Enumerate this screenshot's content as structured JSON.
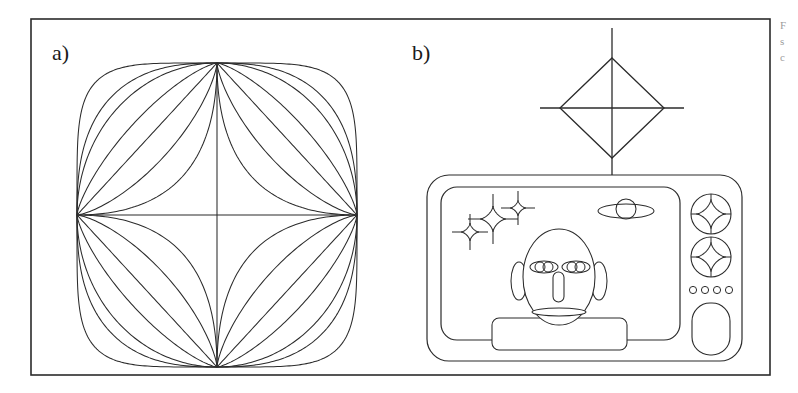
{
  "figure": {
    "background": "#ffffff",
    "stroke": "#2b2b2b",
    "border": {
      "x": 31,
      "y": 19,
      "width": 739,
      "height": 356,
      "stroke_width": 1.6
    }
  },
  "panels": [
    {
      "id": "a",
      "label": "a)",
      "label_x": 52,
      "label_y": 60
    },
    {
      "id": "b",
      "label": "b)",
      "label_x": 412,
      "label_y": 60
    }
  ],
  "caption_overflow": {
    "line1": "F",
    "line2": "s",
    "line3": "c"
  },
  "panel_a": {
    "name": "superellipse-family",
    "center_x": 217,
    "center_y": 215,
    "radius_x": 140,
    "radius_y": 152,
    "exponents": [
      5,
      2.6,
      2,
      1.35,
      1,
      0.72,
      0.5
    ],
    "exponent_labels": [
      "n=5",
      "n=2.6",
      "n=2",
      "n=1.35",
      "n=1",
      "n=0.72",
      "n=0.5"
    ],
    "description": "Nested superellipse curves |x/a|^n + |y/b|^n = 1 sharing the same four axis vertices"
  },
  "panel_b": {
    "name": "retro-television-with-alien",
    "tv_body": {
      "x": 427,
      "y": 175,
      "width": 315,
      "height": 186,
      "radius": 22
    },
    "screen": {
      "x": 441,
      "y": 187,
      "width": 239,
      "height": 153,
      "radius": 16
    },
    "antenna": {
      "mast_x": 612,
      "mast_top": 28,
      "mast_bottom": 175,
      "diamond_center_x": 612,
      "diamond_center_y": 108,
      "diamond_half_width": 52,
      "diamond_half_height": 50,
      "crossbar_left": 540,
      "crossbar_right": 684
    },
    "alien": {
      "head": {
        "cx": 559,
        "cy": 277,
        "rx": 36,
        "ry": 48
      },
      "ear_left": {
        "cx": 519,
        "cy": 281,
        "rx": 8,
        "ry": 19
      },
      "ear_right": {
        "cx": 599,
        "cy": 281,
        "rx": 8,
        "ry": 19
      },
      "eye_left": {
        "cx": 544,
        "cy": 267,
        "rx": 14,
        "ry": 6
      },
      "eye_right": {
        "cx": 576,
        "cy": 267,
        "rx": 14,
        "ry": 6
      },
      "pupil_radius": 5,
      "nose": {
        "x": 553,
        "y": 272,
        "width": 11,
        "height": 30,
        "radius": 5.5
      },
      "mouth": {
        "cx": 559,
        "cy": 312,
        "rx": 27,
        "ry": 4
      },
      "body": {
        "x": 492,
        "y": 318,
        "width": 135,
        "height": 32,
        "radius": 7
      }
    },
    "stars": [
      {
        "cx": 470,
        "cy": 232,
        "size": 9,
        "arm": 18,
        "name": "sparkle-small-left"
      },
      {
        "cx": 493,
        "cy": 219,
        "size": 13,
        "arm": 25,
        "name": "sparkle-large-center"
      },
      {
        "cx": 518,
        "cy": 208,
        "size": 8,
        "arm": 17,
        "name": "sparkle-small-right"
      }
    ],
    "planet": {
      "cx": 626,
      "cy": 211,
      "core_radius": 10,
      "ring_rx": 28,
      "ring_ry": 7,
      "name": "ringed-planet"
    },
    "controls": {
      "knobs": [
        {
          "cx": 711,
          "cy": 214,
          "r": 20,
          "name": "tuner-knob-upper"
        },
        {
          "cx": 711,
          "cy": 257,
          "r": 20,
          "name": "tuner-knob-lower"
        }
      ],
      "indicator_dots": [
        {
          "cx": 693,
          "cy": 290,
          "r": 3.6
        },
        {
          "cx": 705,
          "cy": 290,
          "r": 3.6
        },
        {
          "cx": 717,
          "cy": 290,
          "r": 3.6
        },
        {
          "cx": 729,
          "cy": 290,
          "r": 3.6
        }
      ],
      "speaker_button": {
        "x": 692,
        "y": 303,
        "width": 38,
        "height": 52,
        "radius": 18
      }
    }
  }
}
